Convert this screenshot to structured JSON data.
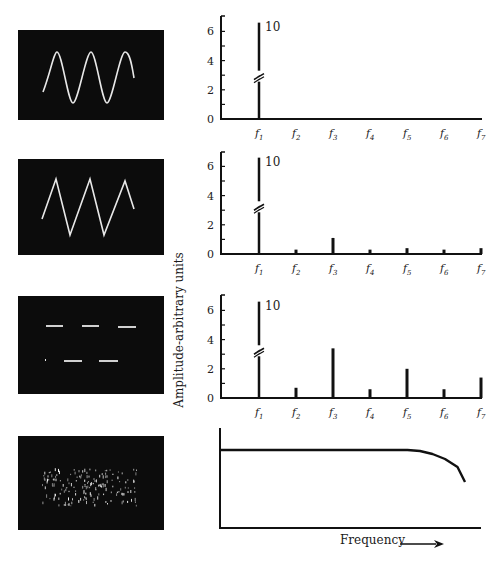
{
  "figure": {
    "y_axis_label": "Amplitude-arbitrary units",
    "x_axis_label": "Frequency",
    "harmonic_labels": [
      "f1",
      "f2",
      "f3",
      "f4",
      "f5",
      "f6",
      "f7"
    ],
    "break_label": "10",
    "oscilloscope_panels": [
      {
        "waveform": "sine"
      },
      {
        "waveform": "triangle"
      },
      {
        "waveform": "square (pulse)"
      },
      {
        "waveform": "noise"
      }
    ]
  },
  "chart_data": [
    {
      "type": "bar",
      "title": "Sine wave spectrum",
      "categories": [
        "f1",
        "f2",
        "f3",
        "f4",
        "f5",
        "f6",
        "f7"
      ],
      "values": [
        10,
        0,
        0,
        0,
        0,
        0,
        0
      ],
      "ylabel": "Amplitude-arbitrary units",
      "yticks": [
        0,
        2,
        4,
        6
      ],
      "ylim": [
        0,
        7
      ],
      "annotations": [
        "f1 bar broken, labeled 10"
      ],
      "grid": false
    },
    {
      "type": "bar",
      "title": "Triangle wave spectrum",
      "categories": [
        "f1",
        "f2",
        "f3",
        "f4",
        "f5",
        "f6",
        "f7"
      ],
      "values": [
        10,
        0.3,
        1.1,
        0.3,
        0.4,
        0.3,
        0.4
      ],
      "ylabel": "Amplitude-arbitrary units",
      "yticks": [
        0,
        2,
        4,
        6
      ],
      "ylim": [
        0,
        7
      ],
      "annotations": [
        "f1 bar broken, labeled 10"
      ],
      "grid": false
    },
    {
      "type": "bar",
      "title": "Square wave spectrum",
      "categories": [
        "f1",
        "f2",
        "f3",
        "f4",
        "f5",
        "f6",
        "f7"
      ],
      "values": [
        10,
        0.7,
        3.4,
        0.6,
        2.0,
        0.6,
        1.4
      ],
      "ylabel": "Amplitude-arbitrary units",
      "yticks": [
        0,
        2,
        4,
        6
      ],
      "ylim": [
        0,
        7
      ],
      "annotations": [
        "f1 bar broken, labeled 10"
      ],
      "grid": false
    },
    {
      "type": "line",
      "title": "Noise spectrum",
      "xlabel": "Frequency",
      "x": [
        0,
        0.25,
        0.5,
        0.7,
        0.75,
        0.8,
        0.85,
        0.9,
        0.95,
        0.98
      ],
      "y": [
        0.78,
        0.78,
        0.78,
        0.78,
        0.78,
        0.77,
        0.74,
        0.69,
        0.61,
        0.46
      ],
      "description": "flat then roll-off at high frequency",
      "grid": false
    }
  ]
}
